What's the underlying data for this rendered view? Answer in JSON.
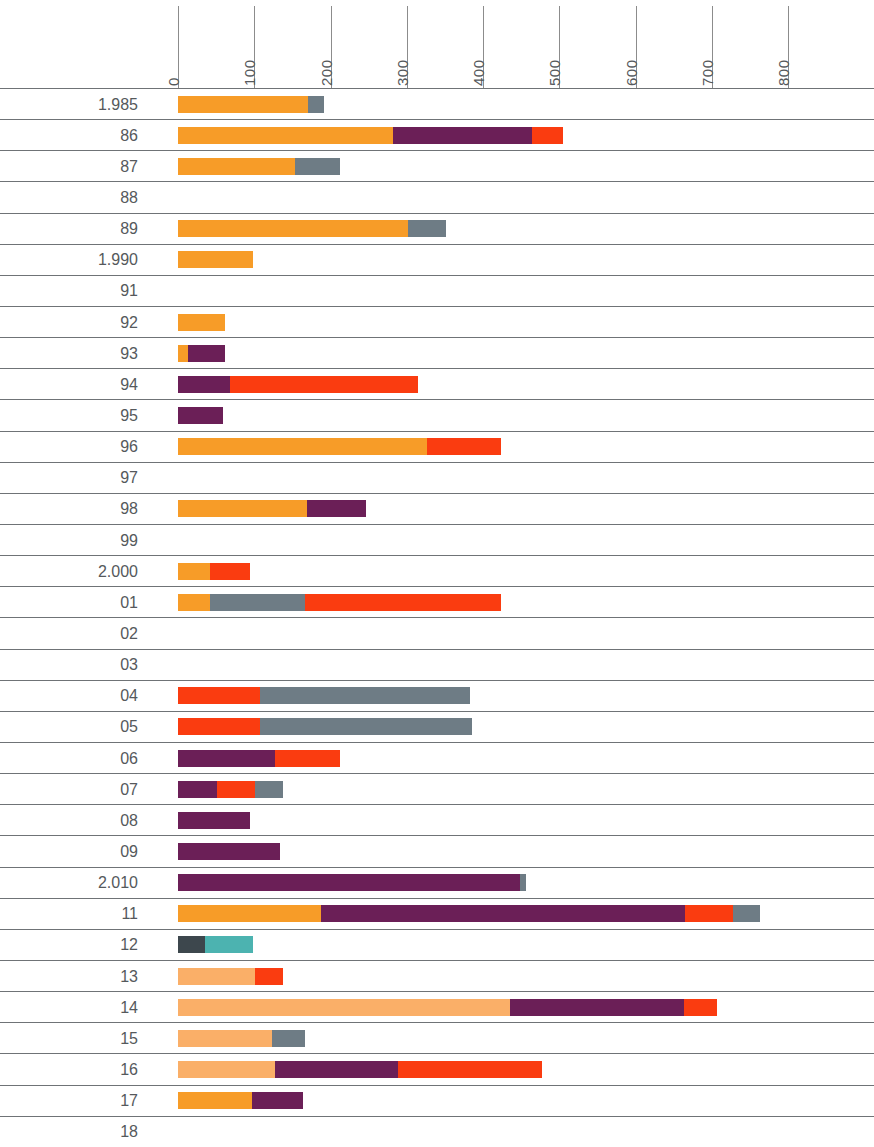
{
  "chart": {
    "type": "bar",
    "orientation": "horizontal",
    "stacked": true,
    "title": "",
    "xlabel": "",
    "ylabel": "",
    "grid": "row-separators-only",
    "legend": "none"
  },
  "axis": {
    "ticks": [
      "0",
      "100",
      "200",
      "300",
      "400",
      "500",
      "600",
      "700",
      "800"
    ],
    "xlim": [
      0,
      800
    ],
    "px_per_unit": 0.7625,
    "x_origin_px": 178
  },
  "colors": {
    "orange": "#F79C28",
    "light_orange": "#FAAF68",
    "purple": "#6B1F57",
    "red": "#FA3C10",
    "gray": "#6E7C85",
    "dark_slate": "#3D474D",
    "teal": "#4CB3B0",
    "rule": "#6F7376",
    "text": "#55595C"
  },
  "chart_data": {
    "type": "bar",
    "title": "",
    "xlabel": "",
    "ylabel": "",
    "xlim": [
      0,
      800
    ],
    "grid": false,
    "legend": "none",
    "stacked": true,
    "orientation": "horizontal",
    "categories": [
      "1.985",
      "86",
      "87",
      "88",
      "89",
      "1.990",
      "91",
      "92",
      "93",
      "94",
      "95",
      "96",
      "97",
      "98",
      "99",
      "2.000",
      "01",
      "02",
      "03",
      "04",
      "05",
      "06",
      "07",
      "08",
      "09",
      "2.010",
      "11",
      "12",
      "13",
      "14",
      "15",
      "16",
      "17",
      "18"
    ],
    "series": [
      {
        "name": "orange",
        "color": "#F79C28",
        "values": [
          170,
          282,
          153,
          0,
          302,
          98,
          0,
          62,
          13,
          0,
          0,
          327,
          0,
          169,
          0,
          42,
          42,
          0,
          0,
          0,
          0,
          0,
          0,
          0,
          0,
          0,
          188,
          0,
          0,
          0,
          0,
          0,
          97,
          0
        ]
      },
      {
        "name": "light-orange",
        "color": "#FAAF68",
        "values": [
          0,
          0,
          0,
          0,
          0,
          0,
          0,
          0,
          0,
          0,
          0,
          0,
          0,
          0,
          0,
          0,
          0,
          0,
          0,
          0,
          0,
          0,
          0,
          0,
          0,
          0,
          0,
          0,
          101,
          435,
          123,
          127,
          0,
          0
        ]
      },
      {
        "name": "purple",
        "color": "#6B1F57",
        "values": [
          0,
          182,
          0,
          0,
          0,
          0,
          0,
          0,
          49,
          68,
          59,
          0,
          0,
          77,
          0,
          0,
          0,
          0,
          0,
          0,
          0,
          127,
          51,
          94,
          134,
          449,
          477,
          0,
          0,
          229,
          0,
          161,
          67,
          0
        ]
      },
      {
        "name": "red",
        "color": "#FA3C10",
        "values": [
          0,
          41,
          0,
          0,
          0,
          0,
          0,
          0,
          0,
          247,
          0,
          96,
          0,
          0,
          0,
          52,
          256,
          0,
          0,
          107,
          107,
          85,
          50,
          0,
          0,
          0,
          63,
          0,
          37,
          43,
          0,
          189,
          0,
          0
        ]
      },
      {
        "name": "gray",
        "color": "#6E7C85",
        "values": [
          22,
          0,
          59,
          0,
          50,
          0,
          0,
          0,
          0,
          0,
          0,
          0,
          0,
          0,
          0,
          0,
          125,
          0,
          0,
          276,
          278,
          0,
          37,
          0,
          0,
          7,
          35,
          0,
          0,
          0,
          43,
          0,
          0,
          0
        ]
      },
      {
        "name": "dark-slate",
        "color": "#3D474D",
        "values": [
          0,
          0,
          0,
          0,
          0,
          0,
          0,
          0,
          0,
          0,
          0,
          0,
          0,
          0,
          0,
          0,
          0,
          0,
          0,
          0,
          0,
          0,
          0,
          0,
          0,
          0,
          0,
          36,
          0,
          0,
          0,
          0,
          0,
          0
        ]
      },
      {
        "name": "teal",
        "color": "#4CB3B0",
        "values": [
          0,
          0,
          0,
          0,
          0,
          0,
          0,
          0,
          0,
          0,
          0,
          0,
          0,
          0,
          0,
          0,
          0,
          0,
          0,
          0,
          0,
          0,
          0,
          0,
          0,
          0,
          0,
          63,
          0,
          0,
          0,
          0,
          0,
          0
        ]
      }
    ],
    "rows": [
      {
        "label": "1.985",
        "segments": [
          {
            "c": "orange",
            "v": 170
          },
          {
            "c": "gray",
            "v": 22
          }
        ]
      },
      {
        "label": "86",
        "segments": [
          {
            "c": "orange",
            "v": 282
          },
          {
            "c": "purple",
            "v": 182
          },
          {
            "c": "red",
            "v": 41
          }
        ]
      },
      {
        "label": "87",
        "segments": [
          {
            "c": "orange",
            "v": 153
          },
          {
            "c": "gray",
            "v": 59
          }
        ]
      },
      {
        "label": "88",
        "segments": []
      },
      {
        "label": "89",
        "segments": [
          {
            "c": "orange",
            "v": 302
          },
          {
            "c": "gray",
            "v": 50
          }
        ]
      },
      {
        "label": "1.990",
        "segments": [
          {
            "c": "orange",
            "v": 98
          }
        ]
      },
      {
        "label": "91",
        "segments": []
      },
      {
        "label": "92",
        "segments": [
          {
            "c": "orange",
            "v": 62
          }
        ]
      },
      {
        "label": "93",
        "segments": [
          {
            "c": "orange",
            "v": 13
          },
          {
            "c": "purple",
            "v": 49
          }
        ]
      },
      {
        "label": "94",
        "segments": [
          {
            "c": "purple",
            "v": 68
          },
          {
            "c": "red",
            "v": 247
          }
        ]
      },
      {
        "label": "95",
        "segments": [
          {
            "c": "purple",
            "v": 59
          }
        ]
      },
      {
        "label": "96",
        "segments": [
          {
            "c": "orange",
            "v": 327
          },
          {
            "c": "red",
            "v": 96
          }
        ]
      },
      {
        "label": "97",
        "segments": []
      },
      {
        "label": "98",
        "segments": [
          {
            "c": "orange",
            "v": 169
          },
          {
            "c": "purple",
            "v": 77
          }
        ]
      },
      {
        "label": "99",
        "segments": []
      },
      {
        "label": "2.000",
        "segments": [
          {
            "c": "orange",
            "v": 42
          },
          {
            "c": "red",
            "v": 52
          }
        ]
      },
      {
        "label": "01",
        "segments": [
          {
            "c": "orange",
            "v": 42
          },
          {
            "c": "gray",
            "v": 125
          },
          {
            "c": "red",
            "v": 256
          }
        ]
      },
      {
        "label": "02",
        "segments": []
      },
      {
        "label": "03",
        "segments": []
      },
      {
        "label": "04",
        "segments": [
          {
            "c": "red",
            "v": 107
          },
          {
            "c": "gray",
            "v": 276
          }
        ]
      },
      {
        "label": "05",
        "segments": [
          {
            "c": "red",
            "v": 107
          },
          {
            "c": "gray",
            "v": 278
          }
        ]
      },
      {
        "label": "06",
        "segments": [
          {
            "c": "purple",
            "v": 127
          },
          {
            "c": "red",
            "v": 85
          }
        ]
      },
      {
        "label": "07",
        "segments": [
          {
            "c": "purple",
            "v": 51
          },
          {
            "c": "red",
            "v": 50
          },
          {
            "c": "gray",
            "v": 37
          }
        ]
      },
      {
        "label": "08",
        "segments": [
          {
            "c": "purple",
            "v": 94
          }
        ]
      },
      {
        "label": "09",
        "segments": [
          {
            "c": "purple",
            "v": 134
          }
        ]
      },
      {
        "label": "2.010",
        "segments": [
          {
            "c": "purple",
            "v": 449
          },
          {
            "c": "gray",
            "v": 7
          }
        ]
      },
      {
        "label": "11",
        "segments": [
          {
            "c": "orange",
            "v": 188
          },
          {
            "c": "purple",
            "v": 477
          },
          {
            "c": "red",
            "v": 63
          },
          {
            "c": "gray",
            "v": 35
          }
        ]
      },
      {
        "label": "12",
        "segments": [
          {
            "c": "dark_slate",
            "v": 36
          },
          {
            "c": "teal",
            "v": 63
          }
        ]
      },
      {
        "label": "13",
        "segments": [
          {
            "c": "light_orange",
            "v": 101
          },
          {
            "c": "red",
            "v": 37
          }
        ]
      },
      {
        "label": "14",
        "segments": [
          {
            "c": "light_orange",
            "v": 435
          },
          {
            "c": "purple",
            "v": 229
          },
          {
            "c": "red",
            "v": 43
          }
        ]
      },
      {
        "label": "15",
        "segments": [
          {
            "c": "light_orange",
            "v": 123
          },
          {
            "c": "gray",
            "v": 43
          }
        ]
      },
      {
        "label": "16",
        "segments": [
          {
            "c": "light_orange",
            "v": 127
          },
          {
            "c": "purple",
            "v": 161
          },
          {
            "c": "red",
            "v": 189
          }
        ]
      },
      {
        "label": "17",
        "segments": [
          {
            "c": "orange",
            "v": 97
          },
          {
            "c": "purple",
            "v": 67
          }
        ]
      },
      {
        "label": "18",
        "segments": []
      }
    ]
  }
}
